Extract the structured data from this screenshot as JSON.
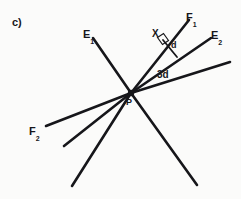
{
  "figure": {
    "part_label": "c)",
    "background_color": "#fbfbfa",
    "stroke_color": "#16161a",
    "width": 241,
    "height": 199,
    "vertex": {
      "name": "P",
      "label": "P",
      "x": 131,
      "y": 93
    },
    "labels": {
      "e1": {
        "base": "E",
        "sub": "1"
      },
      "e2": {
        "base": "E",
        "sub": "2"
      },
      "f1": {
        "base": "F",
        "sub": "1"
      },
      "f2": {
        "base": "F",
        "sub": "2"
      },
      "x": "X",
      "d": "d",
      "three_d": "3d",
      "p": "P"
    },
    "rays": [
      {
        "name": "ray-e1",
        "label": "E1",
        "x1": 131,
        "y1": 93,
        "x2": 93,
        "y2": 38,
        "width": 2.6
      },
      {
        "name": "ray-f1",
        "label": "F1",
        "x1": 131,
        "y1": 93,
        "x2": 189,
        "y2": 20,
        "width": 2.6
      },
      {
        "name": "ray-e2",
        "label": "E2",
        "x1": 131,
        "y1": 93,
        "x2": 211,
        "y2": 38,
        "width": 2.6
      },
      {
        "name": "ray-lower-right-upper",
        "label": "",
        "x1": 131,
        "y1": 93,
        "x2": 230,
        "y2": 62,
        "width": 2.6
      },
      {
        "name": "ray-f2",
        "label": "F2",
        "x1": 131,
        "y1": 93,
        "x2": 46,
        "y2": 126,
        "width": 2.6
      },
      {
        "name": "ray-lower-left-mid",
        "label": "",
        "x1": 131,
        "y1": 93,
        "x2": 64,
        "y2": 146,
        "width": 2.6
      },
      {
        "name": "ray-lower-left-steep",
        "label": "",
        "x1": 131,
        "y1": 93,
        "x2": 72,
        "y2": 186,
        "width": 2.6
      },
      {
        "name": "ray-lower-right-steep",
        "label": "",
        "x1": 131,
        "y1": 93,
        "x2": 197,
        "y2": 185,
        "width": 2.6
      }
    ],
    "perpendicular": {
      "name": "segment-d",
      "from_point": "X",
      "x1": 163,
      "y1": 40,
      "x2": 177,
      "y2": 57,
      "width": 1.8
    },
    "right_angle_mark": {
      "points": "158,38 164,34 169,41 163,45",
      "width": 1.2
    },
    "point_x": {
      "x": 163,
      "y": 40
    }
  }
}
